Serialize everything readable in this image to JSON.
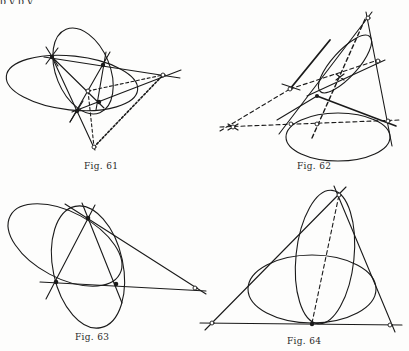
{
  "page": {
    "top_text_fragment": "p y p y"
  },
  "figures": [
    {
      "id": "fig61",
      "caption_prefix": "Fig",
      "caption_number": "61",
      "description": "Two intersecting ellipses with four black intersection points, complete quadrangle lines, and three open diagonal points joined by dashed lines"
    },
    {
      "id": "fig62",
      "caption_prefix": "Fig",
      "caption_number": "62",
      "description": "Two ellipses with common tangent lines, open points and dashed polar lines meeting at crossed points"
    },
    {
      "id": "fig63",
      "caption_prefix": "Fig",
      "caption_number": "63",
      "description": "Two ellipses meeting in three black points forming a triangle, with one open point on an extended side"
    },
    {
      "id": "fig64",
      "caption_prefix": "Fig",
      "caption_number": "64",
      "description": "Triangle circumscribing two ellipses tangent at a common black point on the base, with a dashed line to the apex"
    }
  ],
  "colors": {
    "ink": "#1a1a1a",
    "paper": "#fdfdfc"
  }
}
